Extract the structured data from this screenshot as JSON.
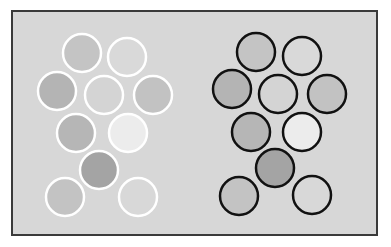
{
  "figure": {
    "background": "#d7d7d7",
    "frame_color": "#3a3a3a",
    "radius": 19,
    "groups": [
      {
        "name": "left-cluster",
        "stroke": "#ffffff",
        "stroke_width": 2.5,
        "circles": [
          {
            "cx": 82,
            "cy": 53,
            "fill": "#c4c4c4"
          },
          {
            "cx": 127,
            "cy": 57,
            "fill": "#d9d9d9"
          },
          {
            "cx": 57,
            "cy": 91,
            "fill": "#b4b4b4"
          },
          {
            "cx": 104,
            "cy": 95,
            "fill": "#d4d4d4"
          },
          {
            "cx": 153,
            "cy": 95,
            "fill": "#c2c2c2"
          },
          {
            "cx": 76,
            "cy": 133,
            "fill": "#b6b6b6"
          },
          {
            "cx": 128,
            "cy": 133,
            "fill": "#ececec"
          },
          {
            "cx": 99,
            "cy": 170,
            "fill": "#a4a4a4"
          },
          {
            "cx": 65,
            "cy": 197,
            "fill": "#c3c3c3"
          },
          {
            "cx": 138,
            "cy": 197,
            "fill": "#d8d8d8"
          }
        ]
      },
      {
        "name": "right-cluster",
        "stroke": "#111111",
        "stroke_width": 2.5,
        "circles": [
          {
            "cx": 256,
            "cy": 52,
            "fill": "#c4c4c4"
          },
          {
            "cx": 302,
            "cy": 56,
            "fill": "#d9d9d9"
          },
          {
            "cx": 232,
            "cy": 89,
            "fill": "#b4b4b4"
          },
          {
            "cx": 278,
            "cy": 94,
            "fill": "#d4d4d4"
          },
          {
            "cx": 327,
            "cy": 94,
            "fill": "#c2c2c2"
          },
          {
            "cx": 251,
            "cy": 132,
            "fill": "#b6b6b6"
          },
          {
            "cx": 302,
            "cy": 132,
            "fill": "#ececec"
          },
          {
            "cx": 275,
            "cy": 168,
            "fill": "#a4a4a4"
          },
          {
            "cx": 239,
            "cy": 196,
            "fill": "#c3c3c3"
          },
          {
            "cx": 312,
            "cy": 195,
            "fill": "#d8d8d8"
          }
        ]
      }
    ]
  }
}
